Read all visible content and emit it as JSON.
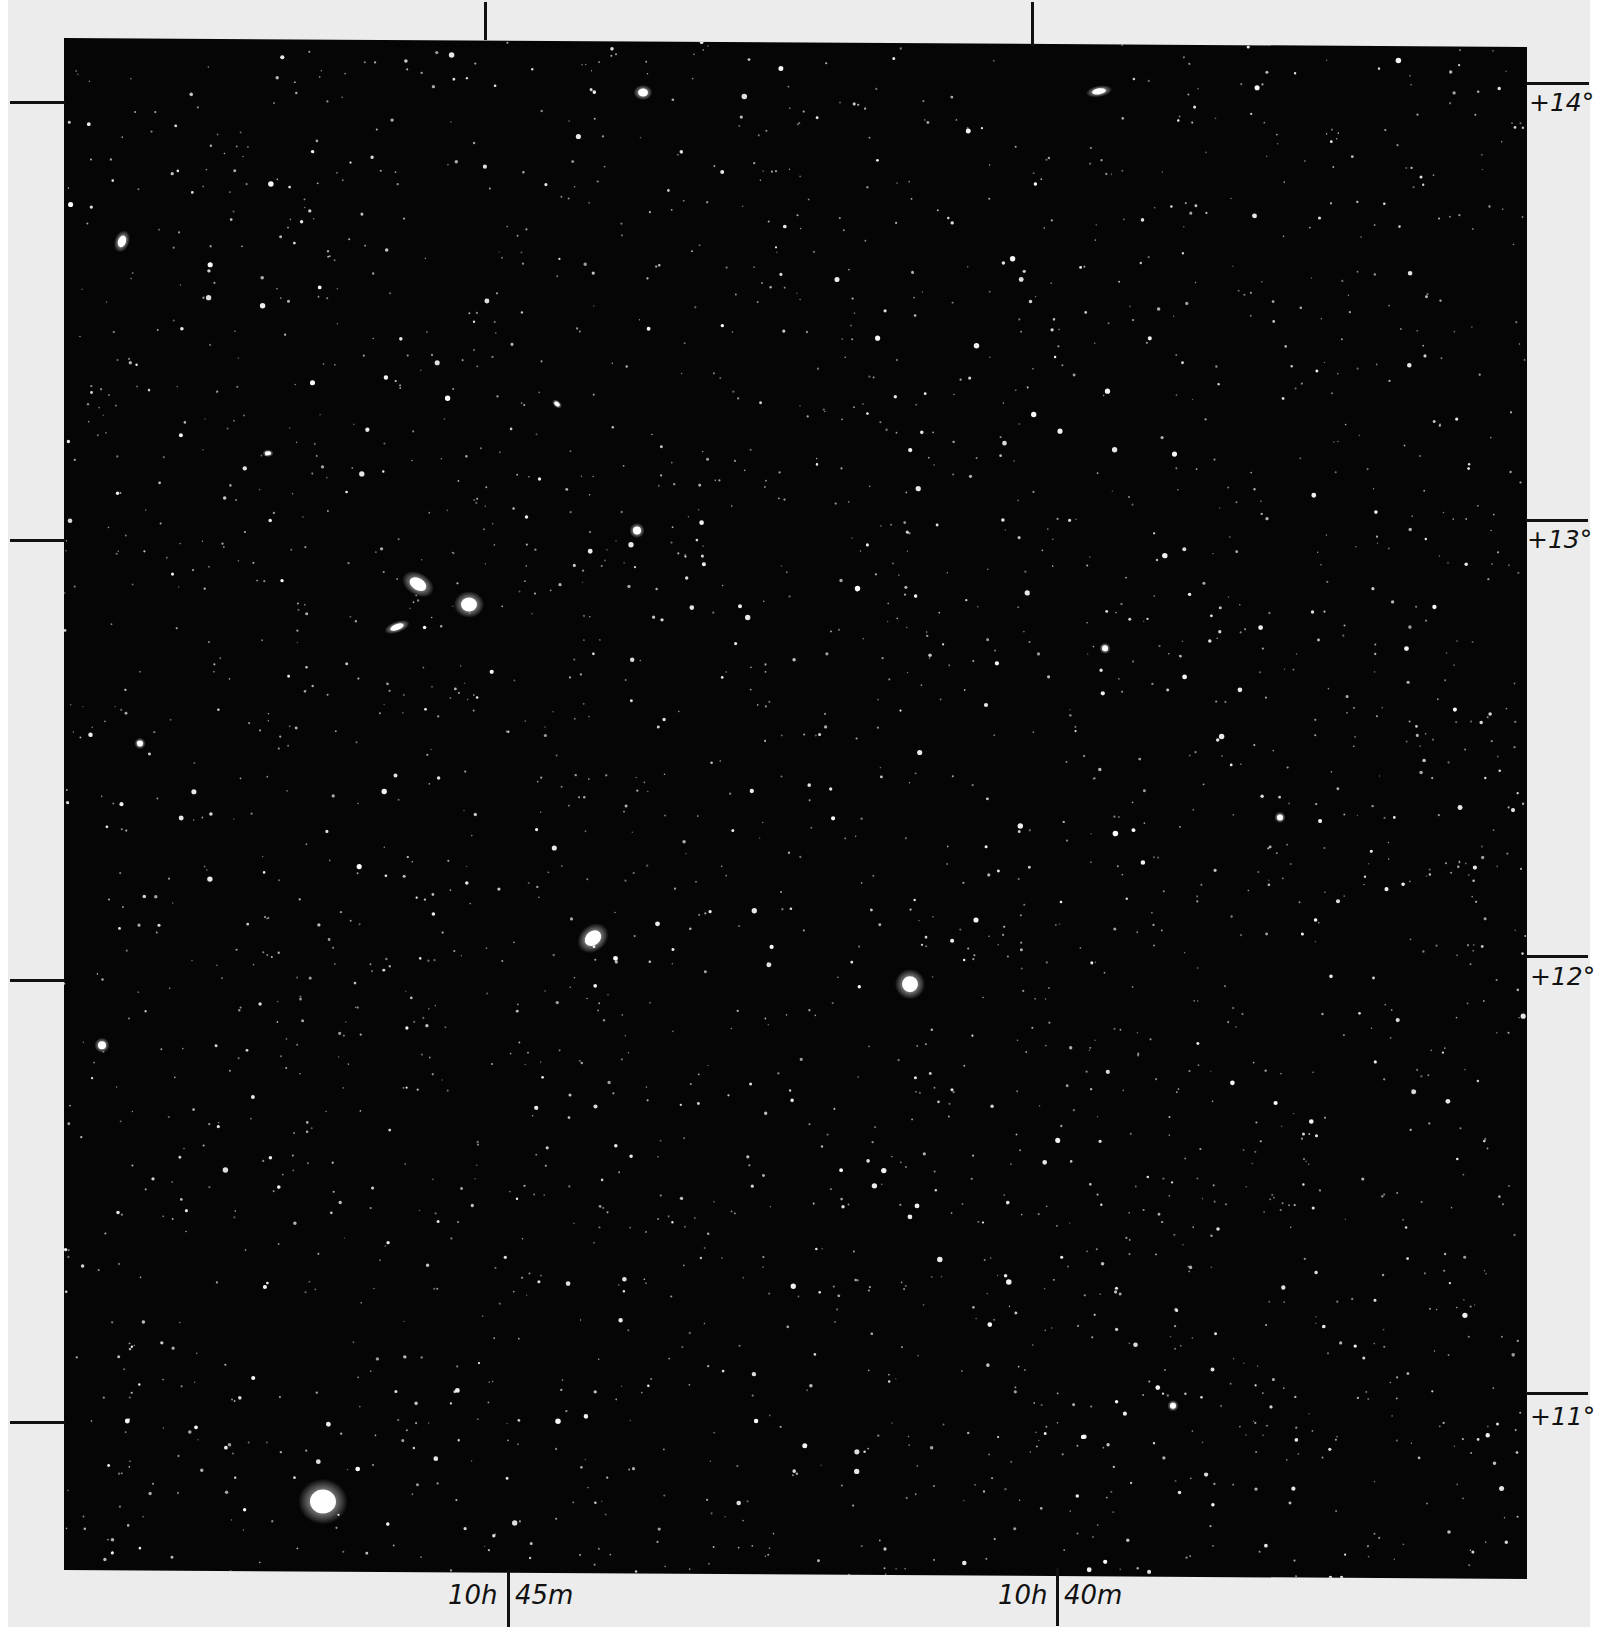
{
  "figure": {
    "type": "astronomical-photographic-plate",
    "paper_color": "#ececec",
    "plate_color": "#050505",
    "ink_color": "#111111"
  },
  "axes": {
    "right_ascension": [
      {
        "hours": "10",
        "hour_unit": "h",
        "minutes": "45",
        "minute_unit": "m",
        "x": 508
      },
      {
        "hours": "10",
        "hour_unit": "h",
        "minutes": "40",
        "minute_unit": "m",
        "x": 1057
      }
    ],
    "declination": [
      {
        "label": "+14°",
        "y_right": 83,
        "y_left": 102
      },
      {
        "label": "+13°",
        "y_right": 520,
        "y_left": 540
      },
      {
        "label": "+12°",
        "y_right": 955,
        "y_left": 980
      },
      {
        "label": "+11°",
        "y_right": 1393,
        "y_left": 1422
      }
    ],
    "top_ticks_x": [
      485,
      1032
    ]
  },
  "labels": {
    "ra_1_h": "10h",
    "ra_1_m": "45m",
    "ra_2_h": "10h",
    "ra_2_m": "40m",
    "dec_14": "+14°",
    "dec_13": "+13°",
    "dec_12": "+12°",
    "dec_11": "+11°"
  },
  "bright_objects": [
    {
      "name": "galaxy",
      "x": 354,
      "y": 544,
      "rx": 9,
      "ry": 6,
      "rot": 30
    },
    {
      "name": "galaxy",
      "x": 405,
      "y": 564,
      "rx": 8,
      "ry": 7,
      "rot": 0
    },
    {
      "name": "galaxy",
      "x": 333,
      "y": 587,
      "rx": 7,
      "ry": 3,
      "rot": -20
    },
    {
      "name": "star",
      "x": 573,
      "y": 489,
      "rx": 4,
      "ry": 4,
      "rot": 0
    },
    {
      "name": "galaxy",
      "x": 529,
      "y": 897,
      "rx": 9,
      "ry": 7,
      "rot": -40
    },
    {
      "name": "galaxy",
      "x": 846,
      "y": 941,
      "rx": 8,
      "ry": 8,
      "rot": 0
    },
    {
      "name": "star",
      "x": 259,
      "y": 1462,
      "rx": 13,
      "ry": 12,
      "rot": 0
    },
    {
      "name": "galaxy",
      "x": 1035,
      "y": 47,
      "rx": 7,
      "ry": 3,
      "rot": -10
    },
    {
      "name": "galaxy",
      "x": 579,
      "y": 51,
      "rx": 5,
      "ry": 4,
      "rot": 0
    },
    {
      "name": "galaxy",
      "x": 58,
      "y": 203,
      "rx": 4,
      "ry": 6,
      "rot": 20
    },
    {
      "name": "star",
      "x": 38,
      "y": 1007,
      "rx": 4,
      "ry": 4,
      "rot": 0
    },
    {
      "name": "star",
      "x": 1109,
      "y": 1361,
      "rx": 3,
      "ry": 3,
      "rot": 0
    },
    {
      "name": "star",
      "x": 76,
      "y": 705,
      "rx": 3,
      "ry": 3,
      "rot": 0
    },
    {
      "name": "star",
      "x": 204,
      "y": 414,
      "rx": 3,
      "ry": 2,
      "rot": 0
    },
    {
      "name": "star",
      "x": 493,
      "y": 363,
      "rx": 3,
      "ry": 2,
      "rot": 40
    },
    {
      "name": "star",
      "x": 1041,
      "y": 604,
      "rx": 3,
      "ry": 3,
      "rot": 0
    },
    {
      "name": "star",
      "x": 1216,
      "y": 772,
      "rx": 3,
      "ry": 3,
      "rot": 0
    }
  ],
  "starfield": {
    "seed": 1337,
    "count": 2600
  }
}
